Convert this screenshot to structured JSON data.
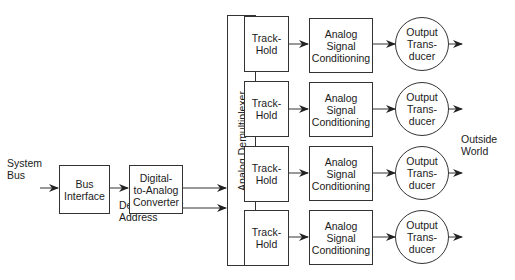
{
  "diagram": {
    "inputs": {
      "system_bus": "System\nBus",
      "demux_address": "Demultiplexer\nAddress"
    },
    "blocks": {
      "bus_interface": "Bus\nInterface",
      "dac": "Digital-\nto-Analog\nConverter",
      "demux": "Analog Demultiplexer"
    },
    "channels": [
      {
        "track_hold": "Track-\nHold",
        "conditioning": "Analog Signal\nConditioning",
        "transducer": "Output\nTrans-\nducer"
      },
      {
        "track_hold": "Track-\nHold",
        "conditioning": "Analog Signal\nConditioning",
        "transducer": "Output\nTrans-\nducer"
      },
      {
        "track_hold": "Track-\nHold",
        "conditioning": "Analog Signal\nConditioning",
        "transducer": "Output\nTrans-\nducer"
      },
      {
        "track_hold": "Track-\nHold",
        "conditioning": "Analog Signal\nConditioning",
        "transducer": "Output\nTrans-\nducer"
      }
    ],
    "output": "Outside\nWorld"
  }
}
